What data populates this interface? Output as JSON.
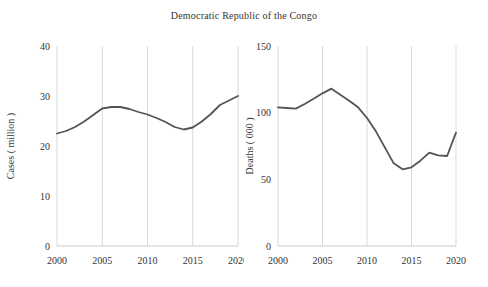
{
  "figure": {
    "title": "Democratic Republic of the Congo",
    "colors": {
      "background": "#ffffff",
      "line": "#545454",
      "grid": "#d9d9d9",
      "axis": "#cccccc",
      "text": "#333333"
    }
  },
  "chart_data": [
    {
      "type": "line",
      "title": "Democratic Republic of the Congo",
      "panel": "left",
      "ylabel": "Cases ( million )",
      "xlabel": "",
      "xlim": [
        2000,
        2020
      ],
      "ylim": [
        0,
        40
      ],
      "xticks": [
        2000,
        2005,
        2010,
        2015,
        2020
      ],
      "yticks": [
        0,
        10,
        20,
        30,
        40
      ],
      "grid": "vertical-only",
      "legend": "none",
      "x": [
        2000,
        2001,
        2002,
        2003,
        2004,
        2005,
        2006,
        2007,
        2008,
        2009,
        2010,
        2011,
        2012,
        2013,
        2014,
        2015,
        2016,
        2017,
        2018,
        2019,
        2020
      ],
      "series": [
        {
          "name": "Cases (million)",
          "values": [
            22.5,
            23.0,
            23.8,
            24.9,
            26.2,
            27.5,
            27.8,
            27.8,
            27.4,
            26.8,
            26.3,
            25.6,
            24.8,
            23.8,
            23.3,
            23.7,
            24.9,
            26.4,
            28.2,
            29.1,
            30.0
          ]
        }
      ]
    },
    {
      "type": "line",
      "title": "Democratic Republic of the Congo",
      "panel": "right",
      "ylabel": "Deaths ( 000 )",
      "xlabel": "",
      "xlim": [
        2000,
        2020
      ],
      "ylim": [
        0,
        150
      ],
      "xticks": [
        2000,
        2005,
        2010,
        2015,
        2020
      ],
      "yticks": [
        0,
        50,
        100,
        150
      ],
      "grid": "vertical-only",
      "legend": "none",
      "x": [
        2000,
        2001,
        2002,
        2003,
        2004,
        2005,
        2006,
        2007,
        2008,
        2009,
        2010,
        2011,
        2012,
        2013,
        2014,
        2015,
        2016,
        2017,
        2018,
        2019,
        2020
      ],
      "series": [
        {
          "name": "Deaths (000)",
          "values": [
            104,
            103.5,
            103,
            106.5,
            110.5,
            114.5,
            118,
            113.5,
            109,
            104,
            96,
            86,
            74,
            62,
            57.5,
            59,
            64,
            70,
            68,
            67.5,
            85
          ]
        }
      ]
    }
  ]
}
